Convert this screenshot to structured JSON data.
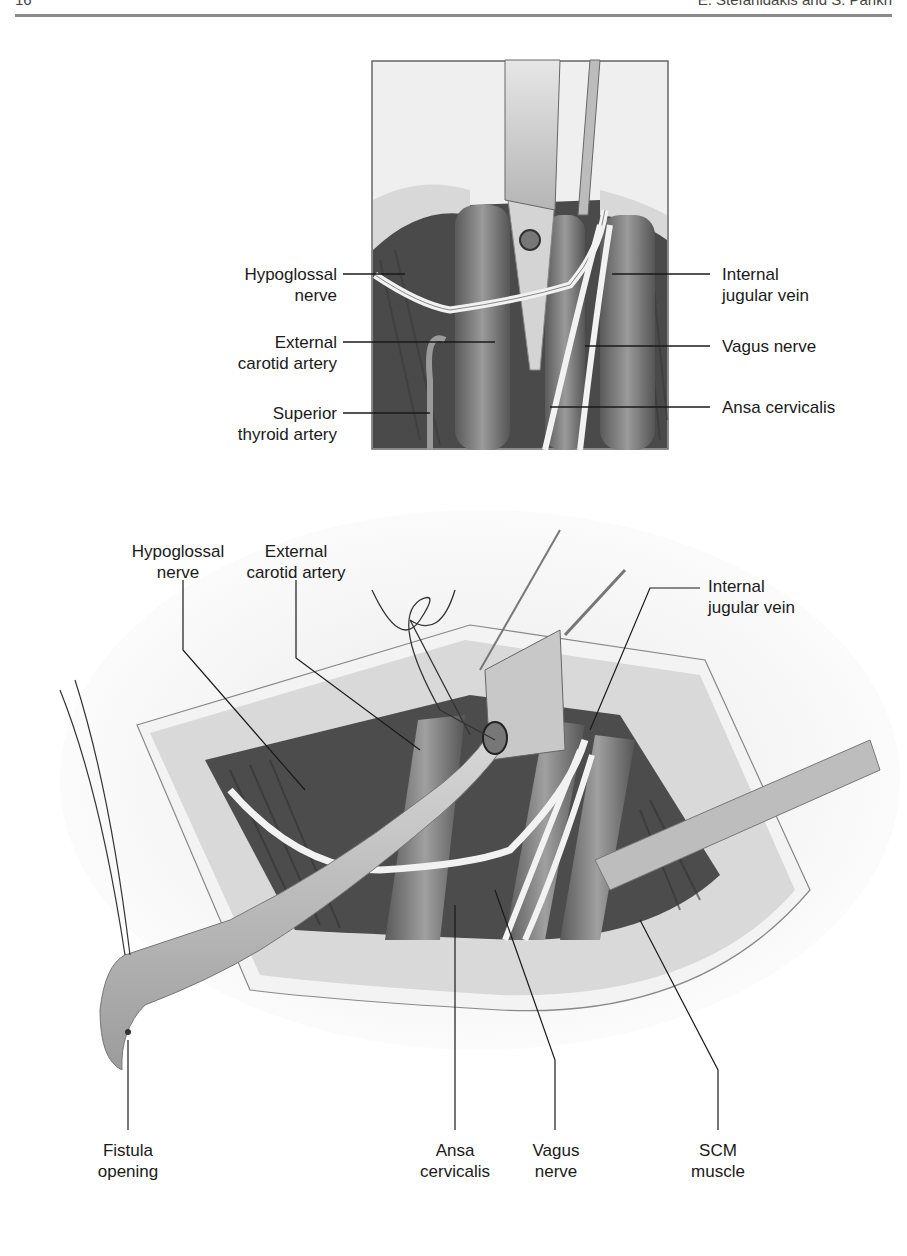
{
  "header": {
    "page_number": "16",
    "running_head": "E. Stefanidakis and S. Parikh"
  },
  "figure_top": {
    "labels_left": [
      {
        "line1": "Hypoglossal",
        "line2": "nerve"
      },
      {
        "line1": "External",
        "line2": "carotid artery"
      },
      {
        "line1": "Superior",
        "line2": "thyroid artery"
      }
    ],
    "labels_right": [
      {
        "line1": "Internal",
        "line2": "jugular vein"
      },
      {
        "line1": "Vagus nerve",
        "line2": ""
      },
      {
        "line1": "Ansa cervicalis",
        "line2": ""
      }
    ]
  },
  "figure_bottom": {
    "labels_top": [
      {
        "line1": "Hypoglossal",
        "line2": "nerve"
      },
      {
        "line1": "External",
        "line2": "carotid artery"
      },
      {
        "line1": "Internal",
        "line2": "jugular vein"
      }
    ],
    "labels_bottom": [
      {
        "line1": "Fistula",
        "line2": "opening"
      },
      {
        "line1": "Ansa",
        "line2": "cervicalis"
      },
      {
        "line1": "Vagus",
        "line2": "nerve"
      },
      {
        "line1": "SCM",
        "line2": "muscle"
      }
    ]
  }
}
